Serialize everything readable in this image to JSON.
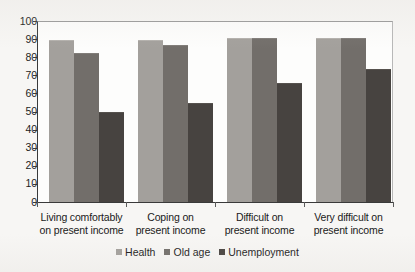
{
  "chart_data": {
    "type": "bar",
    "title": "",
    "subtitle": "",
    "xlabel": "",
    "ylabel": "",
    "ylim": [
      0,
      100
    ],
    "yticks": [
      0,
      10,
      20,
      30,
      40,
      50,
      60,
      70,
      80,
      90,
      100
    ],
    "ytick_labels": [
      "0",
      "10",
      "20",
      "30",
      "40",
      "50",
      "60",
      "70",
      "80",
      "90",
      "100"
    ],
    "grid": false,
    "legend_position": "bottom-center",
    "categories": [
      "Living comfortably on present income",
      "Coping on present income",
      "Difficult on present income",
      "Very difficult on present income"
    ],
    "category_lines": [
      [
        "Living comfortably",
        "on present income"
      ],
      [
        "Coping on",
        "present income"
      ],
      [
        "Difficult on",
        "present income"
      ],
      [
        "Very difficult on",
        "present income"
      ]
    ],
    "series": [
      {
        "name": "Health",
        "color": "#a3a09c",
        "values": [
          89,
          89,
          90,
          90
        ]
      },
      {
        "name": "Old age",
        "color": "#726e6a",
        "values": [
          82,
          86,
          90,
          90
        ]
      },
      {
        "name": "Unemployment",
        "color": "#474340",
        "values": [
          49,
          54,
          65,
          73
        ]
      }
    ]
  }
}
